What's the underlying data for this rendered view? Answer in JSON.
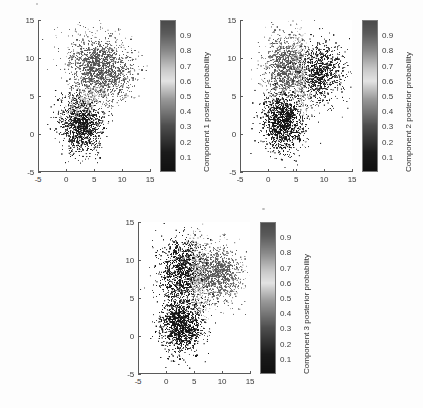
{
  "figure": {
    "background_color": "#fdfdfd",
    "axis_color": "#5a5a5a",
    "text_color": "#3a3a3a"
  },
  "chart_data": [
    {
      "type": "scatter",
      "id": "component-1",
      "title": "",
      "xlabel": "",
      "ylabel": "",
      "xlim": [
        -5,
        15
      ],
      "ylim": [
        -5,
        15
      ],
      "xticks": [
        -5,
        0,
        5,
        10,
        15
      ],
      "yticks": [
        -5,
        0,
        5,
        10,
        15
      ],
      "xticklabels": [
        "-5",
        "0",
        "5",
        "10",
        "15"
      ],
      "yticklabels": [
        "-5",
        "0",
        "5",
        "10",
        "15"
      ],
      "grid": false,
      "colorbar": {
        "label": "Component 1 posterior probability",
        "ticks": [
          0.1,
          0.2,
          0.3,
          0.4,
          0.5,
          0.6,
          0.7,
          0.8,
          0.9
        ],
        "ticklabels": [
          "0.1",
          "0.2",
          "0.3",
          "0.4",
          "0.5",
          "0.6",
          "0.7",
          "0.8",
          "0.9"
        ],
        "vmin": 0,
        "vmax": 1,
        "colormap": "grayscale-wrapped",
        "stops": [
          {
            "pos": 0.0,
            "color": "#101010"
          },
          {
            "pos": 0.12,
            "color": "#1a1a1a"
          },
          {
            "pos": 0.3,
            "color": "#4e4e4e"
          },
          {
            "pos": 0.48,
            "color": "#9a9a9a"
          },
          {
            "pos": 0.6,
            "color": "#e3e3e3"
          },
          {
            "pos": 0.68,
            "color": "#c8c8c8"
          },
          {
            "pos": 0.8,
            "color": "#8a8a8a"
          },
          {
            "pos": 0.92,
            "color": "#5a5a5a"
          },
          {
            "pos": 1.0,
            "color": "#4a4a4a"
          }
        ]
      },
      "clusters": [
        {
          "name": "upper-cluster",
          "cx": 6.2,
          "cy": 8.6,
          "sx": 3.0,
          "sy": 2.1,
          "rot": -0.25,
          "n": 1500,
          "p": 0.96
        },
        {
          "name": "lower-left-cluster",
          "cx": 2.6,
          "cy": 1.4,
          "sx": 1.9,
          "sy": 2.0,
          "rot": 0.62,
          "n": 1200,
          "p": 0.1
        },
        {
          "name": "boundary-band",
          "cx": 3.6,
          "cy": 4.4,
          "sx": 2.2,
          "sy": 0.8,
          "rot": 0.55,
          "n": 260,
          "p": 0.6
        }
      ]
    },
    {
      "type": "scatter",
      "id": "component-2",
      "title": "",
      "xlabel": "",
      "ylabel": "",
      "xlim": [
        -5,
        15
      ],
      "ylim": [
        -5,
        15
      ],
      "xticks": [
        -5,
        0,
        5,
        10,
        15
      ],
      "yticks": [
        -5,
        0,
        5,
        10,
        15
      ],
      "xticklabels": [
        "-5",
        "0",
        "5",
        "10",
        "15"
      ],
      "yticklabels": [
        "-5",
        "0",
        "5",
        "10",
        "15"
      ],
      "grid": false,
      "colorbar": {
        "label": "Component 2 posterior probability",
        "ticks": [
          0.1,
          0.2,
          0.3,
          0.4,
          0.5,
          0.6,
          0.7,
          0.8,
          0.9
        ],
        "ticklabels": [
          "0.1",
          "0.2",
          "0.3",
          "0.4",
          "0.5",
          "0.6",
          "0.7",
          "0.8",
          "0.9"
        ],
        "vmin": 0,
        "vmax": 1,
        "colormap": "grayscale-wrapped",
        "stops": [
          {
            "pos": 0.0,
            "color": "#101010"
          },
          {
            "pos": 0.12,
            "color": "#1a1a1a"
          },
          {
            "pos": 0.3,
            "color": "#4e4e4e"
          },
          {
            "pos": 0.48,
            "color": "#9a9a9a"
          },
          {
            "pos": 0.6,
            "color": "#e3e3e3"
          },
          {
            "pos": 0.68,
            "color": "#c8c8c8"
          },
          {
            "pos": 0.8,
            "color": "#8a8a8a"
          },
          {
            "pos": 0.92,
            "color": "#5a5a5a"
          },
          {
            "pos": 1.0,
            "color": "#4a4a4a"
          }
        ]
      },
      "clusters": [
        {
          "name": "upper-left-lobe",
          "cx": 3.0,
          "cy": 8.9,
          "sx": 2.1,
          "sy": 2.2,
          "rot": -0.35,
          "n": 900,
          "p": 0.94
        },
        {
          "name": "upper-right-lobe",
          "cx": 8.8,
          "cy": 8.1,
          "sx": 2.3,
          "sy": 2.0,
          "rot": -0.15,
          "n": 950,
          "p": 0.12
        },
        {
          "name": "lower-left-cluster",
          "cx": 2.6,
          "cy": 1.5,
          "sx": 1.9,
          "sy": 2.0,
          "rot": 0.62,
          "n": 1100,
          "p": 0.06
        },
        {
          "name": "vertical-boundary-band",
          "cx": 5.6,
          "cy": 8.0,
          "sx": 0.7,
          "sy": 3.0,
          "rot": 0.12,
          "n": 300,
          "p": 0.6
        }
      ]
    },
    {
      "type": "scatter",
      "id": "component-3",
      "title": "",
      "xlabel": "",
      "ylabel": "",
      "xlim": [
        -5,
        15
      ],
      "ylim": [
        -5,
        15
      ],
      "xticks": [
        -5,
        0,
        5,
        10,
        15
      ],
      "yticks": [
        -5,
        0,
        5,
        10,
        15
      ],
      "xticklabels": [
        "-5",
        "0",
        "5",
        "10",
        "15"
      ],
      "yticklabels": [
        "-5",
        "0",
        "5",
        "10",
        "15"
      ],
      "grid": false,
      "colorbar": {
        "label": "Component 3 posterior probability",
        "ticks": [
          0.1,
          0.2,
          0.3,
          0.4,
          0.5,
          0.6,
          0.7,
          0.8,
          0.9
        ],
        "ticklabels": [
          "0.1",
          "0.2",
          "0.3",
          "0.4",
          "0.5",
          "0.6",
          "0.7",
          "0.8",
          "0.9"
        ],
        "vmin": 0,
        "vmax": 1,
        "colormap": "grayscale-wrapped",
        "stops": [
          {
            "pos": 0.0,
            "color": "#101010"
          },
          {
            "pos": 0.12,
            "color": "#1a1a1a"
          },
          {
            "pos": 0.3,
            "color": "#4e4e4e"
          },
          {
            "pos": 0.48,
            "color": "#9a9a9a"
          },
          {
            "pos": 0.6,
            "color": "#e3e3e3"
          },
          {
            "pos": 0.68,
            "color": "#c8c8c8"
          },
          {
            "pos": 0.8,
            "color": "#8a8a8a"
          },
          {
            "pos": 0.92,
            "color": "#5a5a5a"
          },
          {
            "pos": 1.0,
            "color": "#4a4a4a"
          }
        ]
      },
      "clusters": [
        {
          "name": "upper-left-lobe",
          "cx": 2.8,
          "cy": 8.6,
          "sx": 2.2,
          "sy": 2.3,
          "rot": -0.35,
          "n": 1000,
          "p": 0.07
        },
        {
          "name": "upper-right-lobe",
          "cx": 8.9,
          "cy": 8.2,
          "sx": 2.3,
          "sy": 2.0,
          "rot": -0.15,
          "n": 950,
          "p": 0.93
        },
        {
          "name": "lower-left-cluster",
          "cx": 2.5,
          "cy": 1.6,
          "sx": 1.9,
          "sy": 2.0,
          "rot": 0.62,
          "n": 1100,
          "p": 0.05
        },
        {
          "name": "vertical-boundary-band",
          "cx": 5.5,
          "cy": 7.8,
          "sx": 0.7,
          "sy": 3.0,
          "rot": 0.12,
          "n": 300,
          "p": 0.6
        }
      ]
    }
  ],
  "panels": [
    {
      "id": "panel-1",
      "left": 6,
      "top": 6,
      "width": 205,
      "height": 196,
      "axes": {
        "left": 32,
        "top": 14,
        "width": 112,
        "height": 152
      },
      "colorbar_box": {
        "left": 154,
        "top": 14,
        "width": 16,
        "height": 152
      },
      "cbar_label_left": 196,
      "cbar_label_bottom": 166
    },
    {
      "id": "panel-2",
      "left": 212,
      "top": 6,
      "width": 205,
      "height": 196,
      "axes": {
        "left": 28,
        "top": 14,
        "width": 112,
        "height": 152
      },
      "colorbar_box": {
        "left": 150,
        "top": 14,
        "width": 16,
        "height": 152
      },
      "cbar_label_left": 192,
      "cbar_label_bottom": 166
    },
    {
      "id": "panel-3",
      "left": 108,
      "top": 208,
      "width": 205,
      "height": 196,
      "axes": {
        "left": 30,
        "top": 14,
        "width": 112,
        "height": 152
      },
      "colorbar_box": {
        "left": 152,
        "top": 14,
        "width": 16,
        "height": 152
      },
      "cbar_label_left": 194,
      "cbar_label_bottom": 166
    }
  ]
}
